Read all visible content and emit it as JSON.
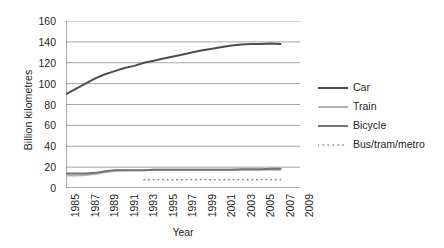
{
  "chart_data": {
    "type": "line",
    "title": "",
    "xlabel": "Year",
    "ylabel": "Billion kilometres",
    "xlim": [
      1985,
      2009
    ],
    "ylim": [
      0,
      160
    ],
    "yticks": [
      0,
      20,
      40,
      60,
      80,
      100,
      120,
      140,
      160
    ],
    "xticks": [
      1985,
      1986,
      1987,
      1988,
      1989,
      1990,
      1991,
      1992,
      1993,
      1994,
      1995,
      1996,
      1997,
      1998,
      1999,
      2000,
      2001,
      2002,
      2003,
      2004,
      2005,
      2006,
      2007,
      2008,
      2009
    ],
    "xtick_labels": [
      "1985",
      "",
      "1987",
      "",
      "1989",
      "",
      "1991",
      "",
      "1993",
      "",
      "1995",
      "",
      "1997",
      "",
      "1999",
      "",
      "2001",
      "",
      "2003",
      "",
      "2005",
      "",
      "2007",
      "",
      "2009"
    ],
    "grid": "horizontal",
    "legend_position": "right",
    "x": [
      1985,
      1986,
      1987,
      1988,
      1989,
      1990,
      1991,
      1992,
      1993,
      1994,
      1995,
      1996,
      1997,
      1998,
      1999,
      2000,
      2001,
      2002,
      2003,
      2004,
      2005,
      2006,
      2007
    ],
    "series": [
      {
        "name": "Car",
        "color": "#4d4d4d",
        "style": "solid",
        "values": [
          90,
          95,
          100,
          105,
          109,
          112,
          115,
          117,
          120,
          122,
          124,
          126,
          128,
          130,
          132,
          133.5,
          135,
          136.5,
          137.5,
          138,
          138,
          138.5,
          138
        ]
      },
      {
        "name": "Train",
        "color": "#b3b3b3",
        "style": "solid",
        "values": [
          12,
          12,
          12.5,
          13.5,
          15,
          16.5,
          17,
          17,
          17,
          17.5,
          17.5,
          17.5,
          17.5,
          17.5,
          17.5,
          17.5,
          17.5,
          17.5,
          17.5,
          17.5,
          17.5,
          17.5,
          17.5
        ]
      },
      {
        "name": "Bicycle",
        "color": "#737373",
        "style": "solid",
        "values": [
          14,
          14,
          14,
          14.5,
          16,
          17,
          17,
          17,
          17,
          17.5,
          17.5,
          17.5,
          17.5,
          17.5,
          17.5,
          17.5,
          17.5,
          17.5,
          18,
          18,
          18,
          18.5,
          18.5
        ]
      },
      {
        "name": "Bus/tram/metro",
        "color": "#8c8c8c",
        "style": "dotted",
        "x_start": 1993,
        "values": [
          null,
          null,
          null,
          null,
          null,
          null,
          null,
          null,
          8,
          8,
          8,
          8,
          8,
          8,
          8,
          8,
          8,
          8,
          8,
          8,
          8,
          8,
          8
        ]
      }
    ]
  },
  "axes": {
    "y_title": "Billion kilometres",
    "x_title": "Year",
    "y_labels": [
      "160",
      "140",
      "120",
      "100",
      "80",
      "60",
      "40",
      "20",
      "0"
    ],
    "x_labels": [
      "1985",
      "1987",
      "1989",
      "1991",
      "1993",
      "1995",
      "1997",
      "1999",
      "2001",
      "2003",
      "2005",
      "2007",
      "2009"
    ]
  },
  "legend": {
    "items": [
      {
        "label": "Car",
        "color": "#4d4d4d",
        "style": "solid",
        "icon": "solid-line-icon"
      },
      {
        "label": "Train",
        "color": "#b3b3b3",
        "style": "solid",
        "icon": "solid-line-icon"
      },
      {
        "label": "Bicycle",
        "color": "#737373",
        "style": "solid",
        "icon": "solid-line-icon"
      },
      {
        "label": "Bus/tram/metro",
        "color": "#8c8c8c",
        "style": "dotted",
        "icon": "dotted-line-icon"
      }
    ]
  },
  "colors": {
    "grid": "#a6a6a6",
    "axis": "#595959",
    "text": "#231f20",
    "background": "#ffffff"
  }
}
